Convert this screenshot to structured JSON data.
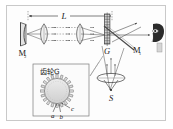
{
  "figure": {
    "kind": "physics-optics-diagram",
    "background_color": "#fdfdfd",
    "frame_color": "#c9c9c9",
    "ink_color": "#1a1a1a",
    "ray_color": "#6b6b6b"
  },
  "labels": {
    "distance_L": "L",
    "mirror_far": "M",
    "mirror_far_sub": "2",
    "mirror_near": "M",
    "mirror_near_sub": "1",
    "toothed_wheel": "G",
    "source": "S"
  },
  "inset": {
    "title": "齿轮G",
    "tooth_a": "a",
    "tooth_b": "b",
    "tooth_c": "c"
  },
  "components": [
    {
      "name": "concave-mirror-M2",
      "label": "M₂",
      "position": "far-left"
    },
    {
      "name": "collimating-lens-left",
      "label": "",
      "position": "left-center"
    },
    {
      "name": "collimating-lens-right",
      "label": "",
      "position": "mid-left"
    },
    {
      "name": "toothed-wheel-G",
      "label": "G",
      "position": "center"
    },
    {
      "name": "beam-splitter-M1",
      "label": "M₁",
      "position": "center-right"
    },
    {
      "name": "condenser-lens-source",
      "label": "",
      "position": "below-center"
    },
    {
      "name": "light-source-S",
      "label": "S",
      "position": "bottom-center"
    },
    {
      "name": "observer-eye",
      "label": "",
      "position": "far-right"
    }
  ]
}
